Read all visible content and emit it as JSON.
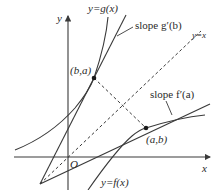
{
  "diagram": {
    "axes": {
      "x_label": "x",
      "y_label": "y",
      "origin_label": "O"
    },
    "curves": {
      "g_label": "y=g(x)",
      "f_label": "y=f(x)",
      "identity_label": "y=x"
    },
    "points": {
      "point_ba_label": "(b,a)",
      "point_ab_label": "(a,b)"
    },
    "slopes": {
      "slope_g_label": "slope g′(b)",
      "slope_f_label": "slope f′(a)"
    },
    "colors": {
      "stroke": "#3a3a3a",
      "text": "#2a2a2a",
      "background": "#ffffff"
    }
  }
}
